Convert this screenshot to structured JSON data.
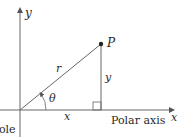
{
  "diagram": {
    "labels": {
      "y_axis": "y",
      "x_axis": "x",
      "point": "P",
      "radius": "r",
      "angle": "θ",
      "y_leg": "y",
      "x_leg": "x",
      "polar_axis": "Polar axis",
      "pole": "Pole"
    },
    "colors": {
      "line": "#555555",
      "text": "#2a2a2a",
      "background": "#ffffff"
    }
  }
}
